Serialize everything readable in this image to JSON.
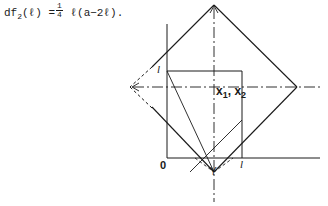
{
  "formula": {
    "lhs_func": "df",
    "lhs_sub": "2",
    "lhs_arg": "(ℓ)",
    "equals": "=",
    "frac_num": "1",
    "frac_den": "4",
    "rhs": "ℓ(a−2ℓ).",
    "full_text": "df₂(ℓ) = 1/4 ℓ(a−2ℓ)."
  },
  "diagram": {
    "type": "geometric-construction",
    "labels": {
      "origin": "0",
      "x_axis_tick": "l",
      "y_axis_tick": "l",
      "region_label": "x₁, x₂",
      "region_label_base": "x",
      "region_label_sub1": "1",
      "region_label_sub2": "2",
      "region_label_sep": ",",
      "bottom_vertex": "Y"
    },
    "colors": {
      "stroke": "#1a1a1a",
      "text": "#1a1a1a",
      "background": "#ffffff"
    },
    "geometry": {
      "origin_px": [
        167,
        158
      ],
      "square_corners_px": [
        [
          167,
          71
        ],
        [
          242,
          71
        ],
        [
          242,
          158
        ],
        [
          167,
          158
        ]
      ],
      "diamond_vertices_px": [
        [
          214,
          5
        ],
        [
          297,
          87
        ],
        [
          214,
          172
        ],
        [
          130,
          87
        ]
      ],
      "h_axis_y_px": 158,
      "v_axis_x_px": 167,
      "h_dashdot_y_px": 87,
      "v_dashdot_x_px": 214
    }
  }
}
